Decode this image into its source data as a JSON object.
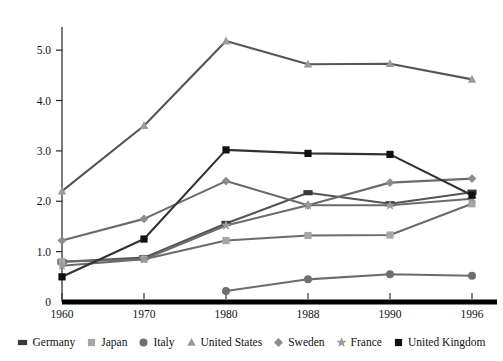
{
  "chart_data": {
    "type": "line",
    "title": "",
    "xlabel": "",
    "ylabel": "",
    "categories": [
      "1960",
      "1970",
      "1980",
      "1988",
      "1990",
      "1996"
    ],
    "ylim": [
      0,
      5.4
    ],
    "yticks": [
      "0",
      "1.0",
      "2.0",
      "3.0",
      "4.0",
      "5.0"
    ],
    "ytick_values": [
      0,
      1.0,
      2.0,
      3.0,
      4.0,
      5.0
    ],
    "grid": false,
    "legend_position": "bottom",
    "series": [
      {
        "name": "Germany",
        "marker": "dash",
        "color": "#3a3a3a",
        "line_color": "#555555",
        "x": [
          "1960",
          "1970",
          "1980",
          "1988",
          "1990",
          "1996"
        ],
        "values": [
          0.8,
          0.88,
          1.56,
          2.17,
          1.95,
          2.18
        ]
      },
      {
        "name": "Japan",
        "marker": "square",
        "color": "#a6a6a6",
        "line_color": "#6b6b6b",
        "x": [
          "1960",
          "1970",
          "1980",
          "1988",
          "1990",
          "1996"
        ],
        "values": [
          0.8,
          0.85,
          1.22,
          1.32,
          1.33,
          1.95
        ]
      },
      {
        "name": "Italy",
        "marker": "circle",
        "color": "#6f6f6f",
        "line_color": "#6b6b6b",
        "x": [
          "1980",
          "1988",
          "1990",
          "1996"
        ],
        "values": [
          0.22,
          0.45,
          0.55,
          0.52
        ]
      },
      {
        "name": "United States",
        "marker": "triangle",
        "color": "#9a9a9a",
        "line_color": "#555555",
        "x": [
          "1960",
          "1970",
          "1980",
          "1988",
          "1990",
          "1996"
        ],
        "values": [
          2.2,
          3.5,
          5.18,
          4.72,
          4.73,
          4.42
        ]
      },
      {
        "name": "Sweden",
        "marker": "diamond",
        "color": "#8c8c8c",
        "line_color": "#6b6b6b",
        "x": [
          "1960",
          "1970",
          "1980",
          "1988",
          "1990",
          "1996"
        ],
        "values": [
          1.22,
          1.65,
          2.4,
          1.92,
          2.37,
          2.45
        ]
      },
      {
        "name": "France",
        "marker": "star",
        "color": "#9a9a9a",
        "line_color": "#6b6b6b",
        "x": [
          "1960",
          "1970",
          "1980",
          "1988",
          "1990",
          "1996"
        ],
        "values": [
          0.72,
          0.85,
          1.52,
          1.92,
          1.92,
          2.05
        ]
      },
      {
        "name": "United Kingdom",
        "marker": "filled-square",
        "color": "#111111",
        "line_color": "#333333",
        "x": [
          "1960",
          "1970",
          "1980",
          "1988",
          "1990",
          "1996"
        ],
        "values": [
          0.5,
          1.25,
          3.02,
          2.95,
          2.93,
          2.12
        ]
      }
    ]
  },
  "axis": {
    "x_axis_name": "x-axis",
    "y_axis_name": "y-axis"
  }
}
